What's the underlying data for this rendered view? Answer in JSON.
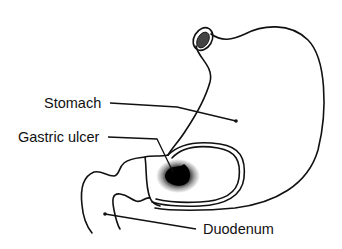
{
  "diagram": {
    "type": "anatomical illustration",
    "labels": {
      "stomach": "Stomach",
      "gastric_ulcer": "Gastric ulcer",
      "duodenum": "Duodenum"
    },
    "colors": {
      "line": "#111111",
      "background": "#ffffff"
    }
  }
}
